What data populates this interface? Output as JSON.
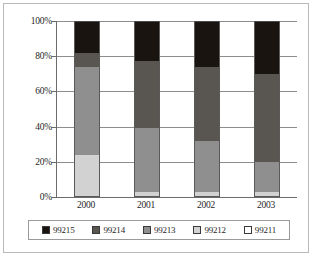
{
  "chart_data": {
    "type": "bar",
    "subtype": "stacked-100-percent",
    "title": "",
    "xlabel": "",
    "ylabel": "",
    "categories": [
      "2000",
      "2001",
      "2002",
      "2003"
    ],
    "ylim": [
      0,
      100
    ],
    "ytick_labels": [
      "0%",
      "20%",
      "40%",
      "60%",
      "80%",
      "100%"
    ],
    "ytick_values": [
      0,
      20,
      40,
      60,
      80,
      100
    ],
    "grid": true,
    "legend_position": "bottom",
    "series": [
      {
        "name": "99215",
        "color": "#1a1410",
        "values": [
          18,
          23,
          26,
          30
        ]
      },
      {
        "name": "99214",
        "color": "#595551",
        "values": [
          8,
          38,
          42,
          50
        ]
      },
      {
        "name": "99213",
        "color": "#8f8f8f",
        "values": [
          50,
          36,
          29,
          17
        ]
      },
      {
        "name": "99212",
        "color": "#d2d2d2",
        "values": [
          24,
          3,
          3,
          3
        ]
      },
      {
        "name": "99211",
        "color": "#ffffff",
        "values": [
          0,
          0,
          0,
          0
        ]
      }
    ]
  },
  "legend": {
    "items": [
      {
        "label": "99215",
        "color": "#1a1410"
      },
      {
        "label": "99214",
        "color": "#595551"
      },
      {
        "label": "99213",
        "color": "#8f8f8f"
      },
      {
        "label": "99212",
        "color": "#d2d2d2"
      },
      {
        "label": "99211",
        "color": "#ffffff"
      }
    ]
  }
}
